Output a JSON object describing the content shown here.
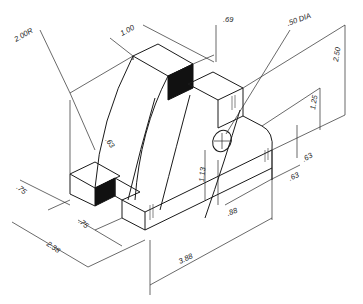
{
  "diagram": {
    "type": "isometric technical drawing",
    "colors": {
      "line": "#1a1a1a",
      "shade": "#111111",
      "background": "#ffffff"
    },
    "dimensions": {
      "radius": "2.00R",
      "top_width": "1.00",
      "top_depth": ".69",
      "hole": ".50 DIA",
      "overall_height": "2.50",
      "boss_height": "1.25",
      "hole_height": "1.13",
      "boss_offset_right": ".63",
      "boss_offset_bottom": ".63",
      "hole_offset": ".88",
      "overall_length": "3.88",
      "slot_depth": ".63",
      "left_foot": ".75",
      "mid_foot": ".75",
      "overall_depth": "2.38"
    }
  }
}
